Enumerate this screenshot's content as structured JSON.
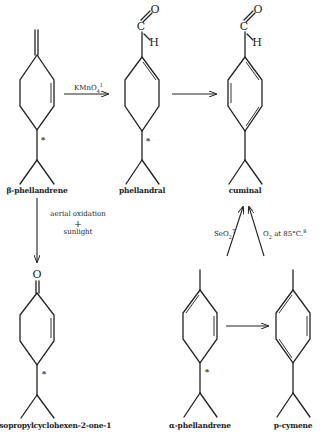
{
  "diagram": {
    "type": "chemical-reaction-scheme",
    "compounds": [
      {
        "id": "beta_phellandrene",
        "label": "β-phellandrene",
        "chiral_marker": "*"
      },
      {
        "id": "phellandral",
        "label": "phellandral",
        "chiral_marker": "*",
        "atoms": {
          "oxygen": "O",
          "carbon": "C",
          "hydrogen": "H"
        }
      },
      {
        "id": "cuminal",
        "label": "cuminal",
        "atoms": {
          "oxygen": "O",
          "carbon": "C",
          "hydrogen": "H"
        }
      },
      {
        "id": "isopropylcyclohexenone",
        "label": "4-isopropylcyclohexen-2-one-1",
        "chiral_marker": "*",
        "atoms": {
          "oxygen": "O"
        }
      },
      {
        "id": "alpha_phellandrene",
        "label": "α-phellandrene",
        "chiral_marker": "*"
      },
      {
        "id": "p_cymene",
        "label": "p-cymene"
      }
    ],
    "reactions": [
      {
        "from": "beta_phellandrene",
        "to": "phellandral",
        "reagent": "KMnO",
        "reagent_sub": "4",
        "reagent_sup": "1"
      },
      {
        "from": "phellandral",
        "to": "cuminal",
        "reagent": ""
      },
      {
        "from": "beta_phellandrene",
        "to": "isopropylcyclohexenone",
        "reagent_line1": "aerial oxidation",
        "reagent_line2": "+",
        "reagent_line3": "sunlight"
      },
      {
        "from": "alpha_phellandrene",
        "to": "cuminal",
        "reagent": "SeO",
        "reagent_sub": "2",
        "reagent_sup": "7"
      },
      {
        "from": "p_cymene",
        "to": "cuminal",
        "reagent": "O",
        "reagent_sub": "2",
        "reagent_tail": " at 85°C.",
        "reagent_sup": "8"
      },
      {
        "from": "alpha_phellandrene",
        "to": "p_cymene",
        "reagent": ""
      }
    ]
  }
}
